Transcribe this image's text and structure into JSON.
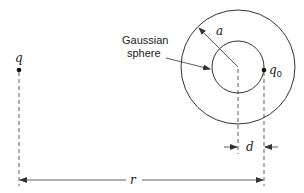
{
  "diagram": {
    "type": "gauss-law-point-charge-geometry",
    "labels": {
      "source_charge": "q",
      "test_charge": "q",
      "test_charge_subscript": "0",
      "radius": "a",
      "offset": "d",
      "distance": "r",
      "gaussian_line1": "Gaussian",
      "gaussian_line2": "sphere"
    },
    "colors": {
      "stroke": "#333333",
      "text": "#222222",
      "background": "#ffffff"
    }
  }
}
